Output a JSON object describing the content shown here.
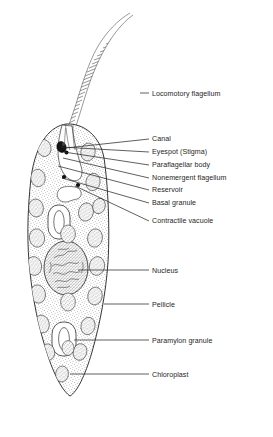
{
  "figure": {
    "organism": "Euglena",
    "background_color": "#ffffff",
    "line_color": "#2b2b2b",
    "text_color": "#262626"
  },
  "labels": [
    {
      "id": "locomotory-flagellum",
      "text": "Locomotory flagellum",
      "text_x": 152,
      "text_y": 96,
      "leader": {
        "x1": 140,
        "y1": 93,
        "x2": 149,
        "y2": 93
      }
    },
    {
      "id": "canal",
      "text": "Canal",
      "text_x": 152,
      "text_y": 141,
      "leader": {
        "x1": 66,
        "y1": 148,
        "x2": 149,
        "y2": 139
      }
    },
    {
      "id": "eyespot-stigma",
      "text": "Eyespot (Stigma)",
      "text_x": 152,
      "text_y": 154,
      "leader": {
        "x1": 61,
        "y1": 147,
        "x2": 149,
        "y2": 152
      }
    },
    {
      "id": "paraflagellar-body",
      "text": "Paraflagellar body",
      "text_x": 152,
      "text_y": 167,
      "leader": {
        "x1": 64,
        "y1": 152,
        "x2": 149,
        "y2": 165
      }
    },
    {
      "id": "nonemergent-flagellum",
      "text": "Nonemergent flagellum",
      "text_x": 152,
      "text_y": 180,
      "leader": {
        "x1": 63,
        "y1": 158,
        "x2": 149,
        "y2": 178
      }
    },
    {
      "id": "reservoir",
      "text": "Reservoir",
      "text_x": 152,
      "text_y": 192,
      "leader": {
        "x1": 58,
        "y1": 166,
        "x2": 149,
        "y2": 190
      }
    },
    {
      "id": "basal-granule",
      "text": "Basal granule",
      "text_x": 152,
      "text_y": 205,
      "leader": {
        "x1": 62,
        "y1": 178,
        "x2": 149,
        "y2": 203
      }
    },
    {
      "id": "contractile-vacuole",
      "text": "Contractile vacuole",
      "text_x": 152,
      "text_y": 223,
      "leader": {
        "x1": 75,
        "y1": 186,
        "x2": 149,
        "y2": 221
      }
    },
    {
      "id": "nucleus",
      "text": "Nucleus",
      "text_x": 152,
      "text_y": 273,
      "leader": {
        "x1": 78,
        "y1": 270,
        "x2": 149,
        "y2": 270
      }
    },
    {
      "id": "pellicle",
      "text": "Pellicle",
      "text_x": 152,
      "text_y": 307,
      "leader": {
        "x1": 104,
        "y1": 304,
        "x2": 149,
        "y2": 304
      }
    },
    {
      "id": "paramylon-granule",
      "text": "Paramylon granule",
      "text_x": 152,
      "text_y": 343,
      "leader": {
        "x1": 74,
        "y1": 340,
        "x2": 149,
        "y2": 340
      }
    },
    {
      "id": "chloroplast",
      "text": "Chloroplast",
      "text_x": 152,
      "text_y": 377,
      "leader": {
        "x1": 70,
        "y1": 374,
        "x2": 149,
        "y2": 374
      }
    }
  ],
  "structures": {
    "cell_body": "teardrop cell outline, widest near nucleus, tapering to pointed tail",
    "flagellum": "long hatched whip curving up and right from anterior canal",
    "eyespot": "small dark pigment blob beside the reservoir",
    "reservoir": "flask-shaped clear cavity at the anterior end",
    "nucleus": "large stippled oval with dense chromatin near cell center",
    "chloroplast_count": 18,
    "paramylon_count": 2
  }
}
